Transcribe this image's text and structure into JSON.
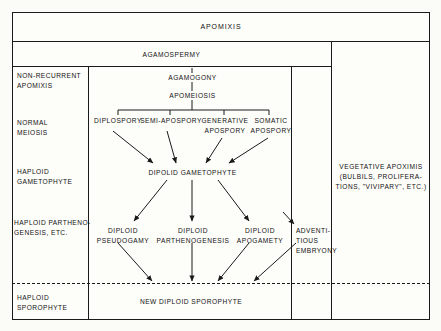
{
  "figure": {
    "title": "APOMIXIS",
    "subtitle": "AGAMOSPERMY"
  },
  "stage_labels": [
    {
      "id": "non-recurrent-apomixis",
      "text": "NON-RECURRENT\nAPOMIXIS"
    },
    {
      "id": "normal-meiosis",
      "text": "NORMAL\nMEIOSIS"
    },
    {
      "id": "haploid-gametophyte",
      "text": "HAPLOID\nGAMETOPHYTE"
    },
    {
      "id": "haploid-parthenogenesis",
      "text": "HAPLOID PARTHENO-\nGENESIS, ETC."
    },
    {
      "id": "haploid-sporophyte",
      "text": "HAPLOID\nSPOROPHYTE"
    }
  ],
  "flow": {
    "agamogony": "AGAMOGONY",
    "apomeiosis": "APOMEIOSIS",
    "branches": [
      {
        "id": "diplospory",
        "text": "DIPLOSPORY"
      },
      {
        "id": "semi-apospory",
        "text": "SEMI-APOSPORY"
      },
      {
        "id": "generative-apospory",
        "text": "GENERATIVE\nAPOSPORY"
      },
      {
        "id": "somatic-apospory",
        "text": "SOMATIC\nAPOSPORY"
      }
    ],
    "gametophyte": "DIPOLID  GAMETOPHYTE",
    "outcomes": [
      {
        "id": "diploid-pseudogamy",
        "text": "DIPLOID\nPSEUDOGAMY"
      },
      {
        "id": "diploid-parthenogenesis",
        "text": "DIPLOID\nPARTHENOGENESIS"
      },
      {
        "id": "diploid-apogamety",
        "text": "DIPLOID\nAPOGAMETY"
      }
    ],
    "result": "NEW  DIPLOID  SPOROPHYTE"
  },
  "adventitious": "ADVENTI-\nTIOUS\nEMBRYONY",
  "vegetative": "VEGETATIVE  APOXIMIS\n(BULBILS, PROLIFERA-\nTIONS, \"VIVIPARY\", ETC.)",
  "colors": {
    "ink": "#1a1a1a",
    "paper": "#fdfdfa"
  }
}
